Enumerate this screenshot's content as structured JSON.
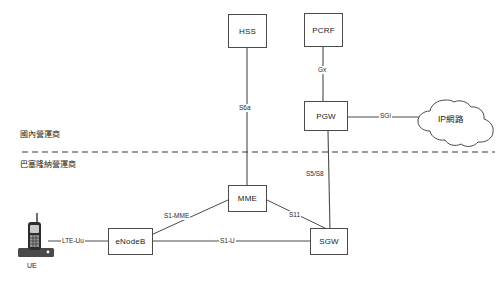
{
  "diagram": {
    "type": "network-architecture",
    "background_color": "#ffffff",
    "line_color": "#4a4a4a",
    "text_color": "#1a1a1a"
  },
  "zones": [
    {
      "id": "domestic",
      "label": "國內營運商"
    },
    {
      "id": "barcelona",
      "label": "巴塞隆納營運商"
    }
  ],
  "divider": {
    "style": "dashed",
    "label": ""
  },
  "nodes": [
    {
      "id": "hss",
      "label": "HSS",
      "shape": "box"
    },
    {
      "id": "pcrf",
      "label": "PCRF",
      "shape": "box"
    },
    {
      "id": "pgw",
      "label": "PGW",
      "shape": "box"
    },
    {
      "id": "mme",
      "label": "MME",
      "shape": "box"
    },
    {
      "id": "sgw",
      "label": "SGW",
      "shape": "box"
    },
    {
      "id": "enodeb",
      "label": "eNodeB",
      "shape": "box"
    },
    {
      "id": "ipnet",
      "label": "IP網路",
      "shape": "cloud"
    },
    {
      "id": "ue",
      "label": "UE",
      "shape": "device"
    }
  ],
  "links": [
    {
      "from": "hss",
      "to": "mme",
      "label": "S6a"
    },
    {
      "from": "pcrf",
      "to": "pgw",
      "label": "Gx"
    },
    {
      "from": "pgw",
      "to": "ipnet",
      "label": "SGi"
    },
    {
      "from": "pgw",
      "to": "sgw",
      "label": "S5/S8"
    },
    {
      "from": "mme",
      "to": "enodeb",
      "label": "S1-MME"
    },
    {
      "from": "mme",
      "to": "sgw",
      "label": "S11"
    },
    {
      "from": "enodeb",
      "to": "sgw",
      "label": "S1-U"
    },
    {
      "from": "ue",
      "to": "enodeb",
      "label": "LTE-Uu"
    }
  ]
}
